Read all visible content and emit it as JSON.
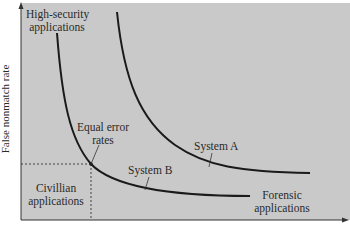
{
  "figure": {
    "ylabel": "False nonmatch rate",
    "xlabel": "",
    "background": "#c9c9c9",
    "line_color": "#1a1a1a",
    "labels": {
      "high_security": [
        "High-security",
        "applications"
      ],
      "equal_error": [
        "Equal error",
        "rates"
      ],
      "system_a": "System A",
      "system_b": "System B",
      "civilian": [
        "Civillian",
        "applications"
      ],
      "forensic": [
        "Forensic",
        "applications"
      ]
    },
    "curves": [
      {
        "name": "System A",
        "description": "tradeoff curve further from origin"
      },
      {
        "name": "System B",
        "description": "tradeoff curve closer to origin"
      }
    ],
    "equal_error_point": "intersection of System B curve with dashed equal-error guide lines"
  }
}
